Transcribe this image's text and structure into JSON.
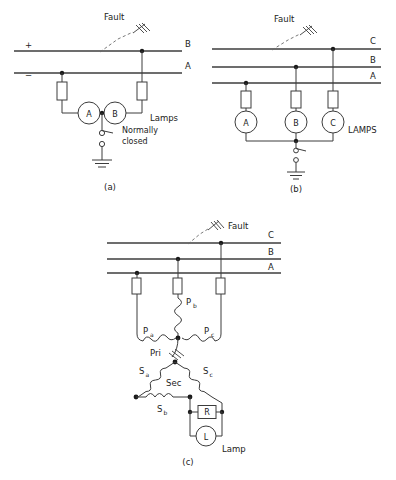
{
  "figure": {
    "background": "#ffffff",
    "line_color": "#3c3c3c",
    "text_color": "#222222"
  },
  "panels": [
    {
      "id": "a",
      "caption": "(a)",
      "system": "two-wire DC",
      "fault_label": "Fault",
      "bus_labels": [
        "B",
        "A"
      ],
      "polarity_labels": [
        "+",
        "−"
      ],
      "meters": [
        "A",
        "B"
      ],
      "lamps_label": "Lamps",
      "switch_label_line1": "Normally",
      "switch_label_line2": "closed",
      "ground": true
    },
    {
      "id": "b",
      "caption": "(b)",
      "system": "three-phase three-wire",
      "fault_label": "Fault",
      "bus_labels": [
        "C",
        "B",
        "A"
      ],
      "meters": [
        "A",
        "B",
        "C"
      ],
      "lamps_label": "LAMPS",
      "ground": true
    },
    {
      "id": "c",
      "caption": "(c)",
      "system": "broken-delta ground detector",
      "fault_label": "Fault",
      "bus_labels": [
        "C",
        "B",
        "A"
      ],
      "primary_label": "Pri",
      "primary_coils": [
        {
          "name": "Pa",
          "base": "P",
          "sub": "a"
        },
        {
          "name": "Pb",
          "base": "P",
          "sub": "b"
        },
        {
          "name": "Pc",
          "base": "P",
          "sub": "c"
        }
      ],
      "secondary_label": "Sec",
      "secondary_coils": [
        {
          "name": "Sa",
          "base": "S",
          "sub": "a"
        },
        {
          "name": "Sb",
          "base": "S",
          "sub": "b"
        },
        {
          "name": "Sc",
          "base": "S",
          "sub": "c"
        }
      ],
      "resistor_label": "R",
      "lamp_meter_label": "L",
      "lamp_label": "Lamp",
      "ground": true
    }
  ]
}
